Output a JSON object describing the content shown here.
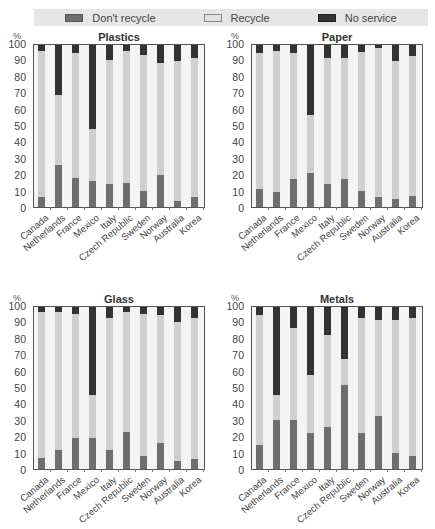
{
  "legend": {
    "items": [
      {
        "key": "dont",
        "label": "Don't recycle",
        "color": "#6e6e6e"
      },
      {
        "key": "recycle",
        "label": "Recycle",
        "color": "#cfcfcf"
      },
      {
        "key": "none",
        "label": "No service",
        "color": "#333333"
      }
    ]
  },
  "axis": {
    "unit": "%",
    "yticks": [
      "100",
      "90",
      "80",
      "70",
      "60",
      "50",
      "40",
      "30",
      "20",
      "10",
      "0"
    ]
  },
  "chart_data": [
    {
      "type": "bar",
      "stacked": true,
      "title": "Plastics",
      "ylabel": "%",
      "ylim": [
        0,
        100
      ],
      "categories": [
        "Canada",
        "Netherlands",
        "France",
        "Mexico",
        "Italy",
        "Czech Republic",
        "Sweden",
        "Norway",
        "Australia",
        "Korea"
      ],
      "series": [
        {
          "name": "Don't recycle",
          "values": [
            6,
            26,
            18,
            16,
            14,
            15,
            10,
            20,
            4,
            6
          ]
        },
        {
          "name": "Recycle",
          "values": [
            90,
            43,
            77,
            32,
            77,
            81,
            84,
            69,
            86,
            86
          ]
        },
        {
          "name": "No service",
          "values": [
            4,
            31,
            5,
            52,
            9,
            4,
            6,
            11,
            10,
            8
          ]
        }
      ]
    },
    {
      "type": "bar",
      "stacked": true,
      "title": "Paper",
      "ylabel": "%",
      "ylim": [
        0,
        100
      ],
      "categories": [
        "Canada",
        "Netherlands",
        "France",
        "Mexico",
        "Italy",
        "Czech Republic",
        "Sweden",
        "Norway",
        "Australia",
        "Korea"
      ],
      "series": [
        {
          "name": "Don't recycle",
          "values": [
            11,
            9,
            17,
            21,
            14,
            17,
            10,
            6,
            5,
            7
          ]
        },
        {
          "name": "Recycle",
          "values": [
            84,
            87,
            78,
            36,
            78,
            75,
            86,
            92,
            85,
            86
          ]
        },
        {
          "name": "No service",
          "values": [
            5,
            4,
            5,
            43,
            8,
            8,
            4,
            2,
            10,
            7
          ]
        }
      ]
    },
    {
      "type": "bar",
      "stacked": true,
      "title": "Glass",
      "ylabel": "%",
      "ylim": [
        0,
        100
      ],
      "categories": [
        "Canada",
        "Netherlands",
        "France",
        "Mexico",
        "Italy",
        "Czech Republic",
        "Sweden",
        "Norway",
        "Australia",
        "Korea"
      ],
      "series": [
        {
          "name": "Don't recycle",
          "values": [
            7,
            12,
            19,
            19,
            12,
            23,
            8,
            16,
            5,
            6
          ]
        },
        {
          "name": "Recycle",
          "values": [
            90,
            85,
            77,
            27,
            81,
            74,
            88,
            79,
            86,
            87
          ]
        },
        {
          "name": "No service",
          "values": [
            3,
            3,
            4,
            54,
            7,
            3,
            4,
            5,
            9,
            7
          ]
        }
      ]
    },
    {
      "type": "bar",
      "stacked": true,
      "title": "Metals",
      "ylabel": "%",
      "ylim": [
        0,
        100
      ],
      "categories": [
        "Canada",
        "Netherlands",
        "France",
        "Mexico",
        "Italy",
        "Czech Republic",
        "Sweden",
        "Norway",
        "Australia",
        "Korea"
      ],
      "series": [
        {
          "name": "Don't recycle",
          "values": [
            15,
            30,
            30,
            22,
            26,
            52,
            22,
            33,
            10,
            8
          ]
        },
        {
          "name": "Recycle",
          "values": [
            80,
            16,
            57,
            36,
            57,
            16,
            71,
            59,
            82,
            85
          ]
        },
        {
          "name": "No service",
          "values": [
            5,
            54,
            13,
            42,
            17,
            32,
            7,
            8,
            8,
            7
          ]
        }
      ]
    }
  ]
}
